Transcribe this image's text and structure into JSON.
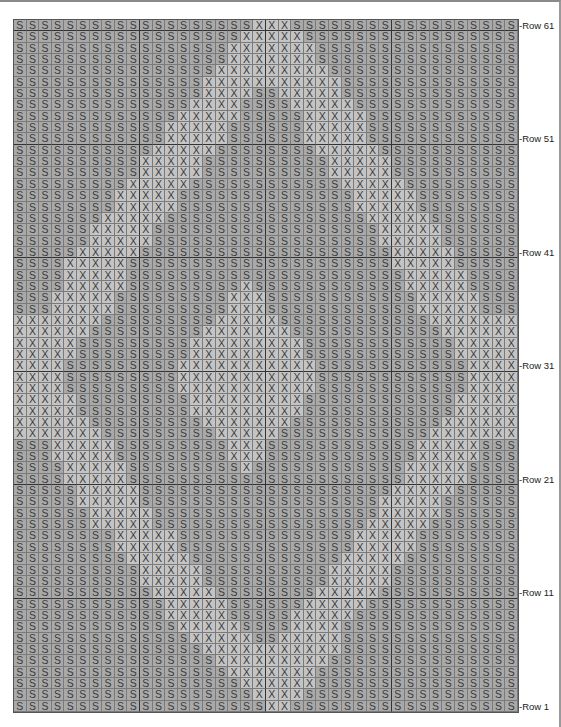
{
  "chart": {
    "columns": 40,
    "symbols": {
      "S": "S",
      "X": "X"
    },
    "row_labels": [
      {
        "row": 61,
        "text": "-Row 61"
      },
      {
        "row": 51,
        "text": "-Row 51"
      },
      {
        "row": 41,
        "text": "-Row 41"
      },
      {
        "row": 31,
        "text": "-Row 31"
      },
      {
        "row": 21,
        "text": "-Row 21"
      },
      {
        "row": 11,
        "text": "-Row 11"
      },
      {
        "row": 1,
        "text": "-Row 1"
      }
    ],
    "rows_top_to_bottom": [
      "SSSSSSSSSSSSSSSSSSSXXXSSSSSSSSSSSSSSSSSS",
      "SSSSSSSSSSSSSSSSSSXXXXXSSSSSSSSSSSSSSSSS",
      "SSSSSSSSSSSSSSSSSXXXXXXXSSSSSSSSSSSSSSSS",
      "SSSSSSSSSSSSSSSSSXXXXXXXSSSSSSSSSSSSSSSS",
      "SSSSSSSSSSSSSSSSXXXXXXXXXSSSSSSSSSSSSSSS",
      "SSSSSSSSSSSSSSSXXXXXXXXXXXSSSSSSSSSSSSSS",
      "SSSSSSSSSSSSSSSXXXXSSXXXXXSSSSSSSSSSSSSS",
      "SSSSSSSSSSSSSSXXXXSSSSXXXXXSSSSSSSSSSSSS",
      "SSSSSSSSSSSSSXXXXXSSSSSXXXXXSSSSSSSSSSSS",
      "SSSSSSSSSSSSXXXXXSSSSSSXXXXXSSSSSSSSSSSS",
      "SSSSSSSSSSSSXXXXXSSSSSSXXXXXSSSSSSSSSSSS",
      "SSSSSSSSSSSXXXXXSSSSSSSSXXXXXSSSSSSSSSSS",
      "SSSSSSSSSSXXXXXSSSSSSSSSSXXXXXSSSSSSSSSS",
      "SSSSSSSSSSXXXXXSSSSSSSSSSXXXXXSSSSSSSSSS",
      "SSSSSSSSSXXXXXSSSSSSSSSSSSXXXXXSSSSSSSSS",
      "SSSSSSSSXXXXXSSSSSSSSSSSSSSXXXXXSSSSSSSS",
      "SSSSSSSSXXXXXSSSSSSSSSSSSSSXXXXXSSSSSSSS",
      "SSSSSSSXXXXXSSSSSSSSSSSSSSSSXXXXXSSSSSSS",
      "SSSSSSXXXXXSSSSSSSSSSSSSSSSSSXXXXXSSSSSS",
      "SSSSSSXXXXXSSSSSSSSSSSSSSSSSSXXXXXSSSSSS",
      "SSSSSXXXXXSSSSSSSSSSSSSSSSSSSSXXXXXSSSSS",
      "SSSSXXXXXSSSSSSSSSSSSSSSSSSSSSXXXXXSSSSS",
      "SSSSXXXXXSSSSSSSSSSSSSSSSSSSSSSXXXXXSSSS",
      "SSSSXXXXXSSSSSSSSSXSSSSSSSSSSSSXXXXXSSSS",
      "SSSXXXXXSSSSSSSSSXXXSSSSSSSSSSSSXXXXXSSS",
      "SSSXXXXXSSSSSSSSSXXXSSSSSSSSSSSSXXXXXSSS",
      "XXXXXXXSSSSSSSSSXXXXXSSSSSSSSSSSSXXXXXXX",
      "XXXXXXSSSSSSSSSXXXXXXXSSSSSSSSSSSSXXXXXX",
      "XXXXXSSSSSSSSSXXXXXXXXXSSSSSSSSSSSSXXXXX",
      "XXXXXSSSSSSSSSXXXXXXXXXSSSSSSSSSSSSXXXXX",
      "XXXXSSSSSSSSSXXXXXXXXXXXSSSSSSSSSSSSXXXX",
      "XXXXSSSSSSSSSXXXXXXXXXXXSSSSSSSSSSSSXXXX",
      "XXXXSSSSSSSSSXXXXXXXXXXXSSSSSSSSSSSSXXXX",
      "XXXXXSSSSSSSSSXXXXXXXXXSSSSSSSSSSSSXXXXX",
      "XXXXXSSSSSSSSSXXXXXXXXXSSSSSSSSSSSSXXXXX",
      "XXXXXXSSSSSSSSSXXXXXXXSSSSSSSSSSSSXXXXXX",
      "XXXXXXXSSSSSSSSSXXXXXSSSSSSSSSSSSXXXXXXX",
      "SSSXXXXXSSSSSSSSSXXXSSSSSSSSSSSSXXXXXSSS",
      "SSSXXXXXSSSSSSSSSXXXSSSSSSSSSSSSXXXXXSSS",
      "SSSSXXXXXSSSSSSSSSXSSSSSSSSSSSSXXXXXSSSS",
      "SSSSXXXXXSSSSSSSSSSSSSSSSSSSSSSXXXXXSSSS",
      "SSSSSXXXXXSSSSSSSSSSSSSSSSSSSSXXXXXSSSSS",
      "SSSSSXXXXXSSSSSSSSSSSSSSSSSSSXXXXXSSSSSS",
      "SSSSSSXXXXXSSSSSSSSSSSSSSSSSSXXXXXSSSSSS",
      "SSSSSSXXXXXSSSSSSSSSSSSSSSSSXXXXXSSSSSSS",
      "SSSSSSSSXXXXXSSSSSSSSSSSSSSXXXXXSSSSSSSS",
      "SSSSSSSSXXXXXSSSSSSSSSSSSSSXXXXXSSSSSSSS",
      "SSSSSSSSSXXXXXSSSSSSSSSSSSXXXXXSSSSSSSSS",
      "SSSSSSSSSSXXXXXSSSSSSSSSSXXXXXSSSSSSSSSS",
      "SSSSSSSSSSXXXXXSSSSSSSSSSXXXXXSSSSSSSSSS",
      "SSSSSSSSSSSXXXXXSSSSSSSSXXXXXSSSSSSSSSSS",
      "SSSSSSSSSSSSXXXXXSSSSSSXXXXXSSSSSSSSSSSS",
      "SSSSSSSSSSSSXXXXXSSSSSXXXXXSSSSSSSSSSSSS",
      "SSSSSSSSSSSSSXXXXXSSSSXXXXSSSSSSSSSSSSSS",
      "SSSSSSSSSSSSSSXXXXXSSXXXXXSSSSSSSSSSSSSS",
      "SSSSSSSSSSSSSSSXXXXXXXXXXXSSSSSSSSSSSSSS",
      "SSSSSSSSSSSSSSSSXXXXXXXXXSSSSSSSSSSSSSSS",
      "SSSSSSSSSSSSSSSSSXXXXXXXSSSSSSSSSSSSSSSS",
      "SSSSSSSSSSSSSSSSSSXXXXXXSSSSSSSSSSSSSSSS",
      "SSSSSSSSSSSSSSSSSSSXXXXSSSSSSSSSSSSSSSSS",
      "SSSSSSSSSSSSSSSSSSSSXXSSSSSSSSSSSSSSSSSS"
    ]
  }
}
